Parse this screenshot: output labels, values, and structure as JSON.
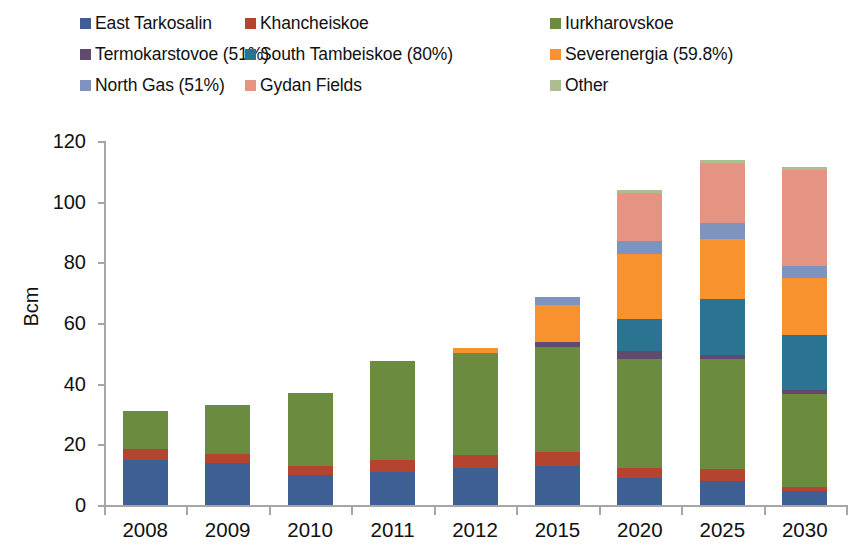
{
  "chart_data": {
    "type": "bar",
    "stacked": true,
    "title": "",
    "xlabel": "",
    "ylabel": "Bcm",
    "ylim": [
      0,
      120
    ],
    "yticks": [
      0,
      20,
      40,
      60,
      80,
      100,
      120
    ],
    "grid": false,
    "legend_position": "top",
    "categories": [
      "2008",
      "2009",
      "2010",
      "2011",
      "2012",
      "2015",
      "2020",
      "2025",
      "2030"
    ],
    "series": [
      {
        "name": "East Tarkosalin",
        "color": "#3d5f93",
        "values": [
          14.7,
          14.0,
          10.0,
          11.0,
          12.3,
          13.0,
          9.0,
          7.8,
          4.5
        ]
      },
      {
        "name": "Khancheiskoe",
        "color": "#b4442f",
        "values": [
          3.7,
          2.8,
          2.7,
          4.0,
          4.2,
          4.6,
          3.3,
          4.0,
          1.5
        ]
      },
      {
        "name": "Iurkharovskoe",
        "color": "#6b8b3e",
        "values": [
          12.6,
          16.2,
          24.3,
          32.5,
          33.6,
          34.6,
          36.0,
          36.4,
          30.6
        ]
      },
      {
        "name": "Termokarstovoe (51%)",
        "color": "#604a6e",
        "values": [
          0,
          0,
          0,
          0,
          0,
          1.6,
          2.6,
          1.3,
          1.2
        ]
      },
      {
        "name": "South Tambeiskoe (80%)",
        "color": "#2a7391",
        "values": [
          0,
          0,
          0,
          0,
          0,
          0,
          10.5,
          18.5,
          18.2
        ]
      },
      {
        "name": "Severenergia (59.8%)",
        "color": "#f7922f",
        "values": [
          0,
          0,
          0,
          0,
          1.7,
          12.2,
          21.5,
          19.8,
          18.8
        ]
      },
      {
        "name": "North Gas (51%)",
        "color": "#8093bf",
        "values": [
          0,
          0,
          0,
          0,
          0,
          2.6,
          4.3,
          5.3,
          4.0
        ]
      },
      {
        "name": "Gydan Fields",
        "color": "#e59383",
        "values": [
          0,
          0,
          0,
          0,
          0,
          0,
          15.8,
          19.8,
          31.7
        ]
      },
      {
        "name": "Other",
        "color": "#aebd90",
        "values": [
          0,
          0,
          0,
          0,
          0,
          0,
          0.8,
          1.0,
          1.0
        ]
      }
    ],
    "totals": [
      31,
      33,
      37,
      47.5,
      51.8,
      68.6,
      103.8,
      113.9,
      111.5
    ]
  },
  "legend": {
    "rows": [
      [
        {
          "label": "East Tarkosalin",
          "swatch": "#3d5f93"
        },
        {
          "label": "Khancheiskoe",
          "swatch": "#b4442f"
        },
        {
          "label": "Iurkharovskoe",
          "swatch": "#6b8b3e"
        }
      ],
      [
        {
          "label": "Termokarstovoe (51%)",
          "swatch": "#604a6e"
        },
        {
          "label": "South Tambeiskoe (80%)",
          "swatch": "#2a7391"
        },
        {
          "label": "Severenergia (59.8%)",
          "swatch": "#f7922f"
        }
      ],
      [
        {
          "label": "North Gas (51%)",
          "swatch": "#8093bf"
        },
        {
          "label": "Gydan Fields",
          "swatch": "#e59383"
        },
        {
          "label": "Other",
          "swatch": "#aebd90"
        }
      ]
    ]
  },
  "axis": {
    "y_label": "Bcm",
    "y_ticks": [
      "0",
      "20",
      "40",
      "60",
      "80",
      "100",
      "120"
    ],
    "x_ticks": [
      "2008",
      "2009",
      "2010",
      "2011",
      "2012",
      "2015",
      "2020",
      "2025",
      "2030"
    ]
  }
}
